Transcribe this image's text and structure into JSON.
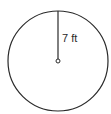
{
  "diagram": {
    "shape": "circle",
    "center": {
      "x": 58,
      "y": 61
    },
    "radius_px": 50,
    "radius_label": "7 ft",
    "stroke_color": "#2a2a2a",
    "fill_color": "#ffffff"
  }
}
